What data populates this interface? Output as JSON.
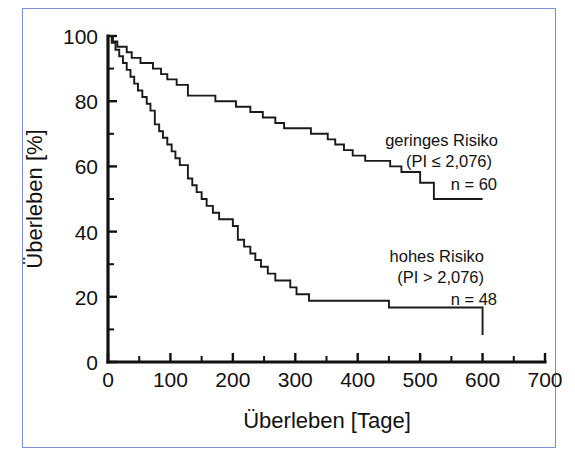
{
  "figure": {
    "border_color": "#7b8fd4",
    "background": "#ffffff",
    "curve_color": "#1a1a1a"
  },
  "chart_data": {
    "type": "line",
    "subtype": "kaplan-meier-step",
    "title": "",
    "xlabel": "Überleben [Tage]",
    "ylabel": "Überleben [%]",
    "xlim": [
      0,
      700
    ],
    "ylim": [
      0,
      100
    ],
    "xticks": [
      0,
      100,
      200,
      300,
      400,
      500,
      600,
      700
    ],
    "xticklabels": [
      "0",
      "100",
      "200",
      "300",
      "400",
      "500",
      "600",
      "700"
    ],
    "xminor_step": 50,
    "yticks": [
      0,
      20,
      40,
      60,
      80,
      100
    ],
    "yticklabels": [
      "0",
      "20",
      "40",
      "60",
      "80",
      "100"
    ],
    "yminor_step": 10,
    "grid": false,
    "legend_position": "inside-right",
    "series": [
      {
        "name": "geringes Risiko",
        "label_lines": [
          "geringes Risiko",
          "(PI ≤ 2,076)",
          "n = 60"
        ],
        "n": 60,
        "prognostic_index": "PI ≤ 2,076",
        "x": [
          0,
          8,
          15,
          22,
          30,
          38,
          45,
          52,
          60,
          72,
          85,
          95,
          110,
          128,
          150,
          172,
          190,
          205,
          218,
          228,
          238,
          248,
          258,
          268,
          282,
          296,
          312,
          325,
          340,
          352,
          364,
          378,
          392,
          412,
          432,
          452,
          470,
          488,
          500,
          512,
          522,
          600
        ],
        "y": [
          100,
          98.3,
          96.7,
          96.7,
          95.0,
          93.3,
          93.3,
          91.7,
          91.7,
          90.0,
          88.3,
          86.7,
          85.0,
          81.7,
          81.7,
          80.0,
          80.0,
          78.3,
          78.3,
          76.7,
          76.7,
          75.0,
          75.0,
          73.3,
          71.7,
          71.7,
          71.7,
          70.0,
          70.0,
          68.3,
          66.7,
          65.0,
          63.3,
          61.7,
          61.7,
          60.0,
          58.3,
          58.3,
          55.0,
          55.0,
          50.0,
          50.0
        ]
      },
      {
        "name": "hohes Risiko",
        "label_lines": [
          "hohes Risiko",
          "(PI > 2,076)",
          "n = 48"
        ],
        "n": 48,
        "prognostic_index": "PI > 2,076",
        "x": [
          0,
          6,
          12,
          18,
          24,
          30,
          36,
          42,
          48,
          55,
          62,
          68,
          75,
          82,
          88,
          95,
          102,
          108,
          115,
          122,
          128,
          135,
          142,
          150,
          158,
          168,
          178,
          190,
          200,
          208,
          218,
          228,
          236,
          245,
          256,
          268,
          280,
          292,
          302,
          312,
          322,
          332,
          440,
          450,
          594,
          600
        ],
        "y": [
          100,
          97.9,
          95.8,
          93.8,
          91.7,
          89.6,
          87.5,
          85.4,
          83.3,
          81.3,
          79.2,
          77.1,
          72.9,
          70.8,
          68.8,
          66.7,
          64.6,
          62.5,
          60.4,
          60.4,
          56.3,
          54.2,
          52.1,
          50.0,
          47.9,
          45.8,
          43.8,
          43.8,
          41.7,
          37.5,
          35.4,
          33.3,
          31.3,
          29.2,
          27.1,
          25.0,
          25.0,
          22.9,
          20.8,
          20.8,
          18.8,
          18.8,
          18.8,
          16.7,
          16.7,
          8.3
        ]
      }
    ],
    "annotations": [
      {
        "text": "geringes Risiko",
        "x_px": 475,
        "y_px": 140
      },
      {
        "text": "(PI ≤ 2,076)",
        "x_px": 475,
        "y_px": 160
      },
      {
        "text": "n = 60",
        "x_px": 490,
        "y_px": 183
      },
      {
        "text": "hohes Risiko",
        "x_px": 472,
        "y_px": 256
      },
      {
        "text": "(PI > 2,076)",
        "x_px": 472,
        "y_px": 276
      },
      {
        "text": "n = 48",
        "x_px": 490,
        "y_px": 297
      }
    ]
  }
}
